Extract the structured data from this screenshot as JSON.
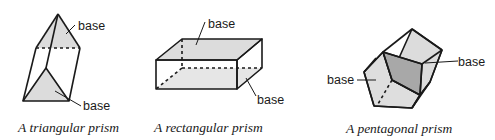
{
  "figures": [
    {
      "id": "triangular",
      "caption": "A triangular prism",
      "labels": [
        "base",
        "base"
      ]
    },
    {
      "id": "rectangular",
      "caption": "A rectangular prism",
      "labels": [
        "base",
        "base"
      ]
    },
    {
      "id": "pentagonal",
      "caption": "A pentagonal prism",
      "labels": [
        "base",
        "base"
      ]
    }
  ],
  "colors": {
    "stroke": "#1a1a1a",
    "base_fill": "#dcdcdc",
    "dark_base_fill": "#a8a8a8"
  }
}
